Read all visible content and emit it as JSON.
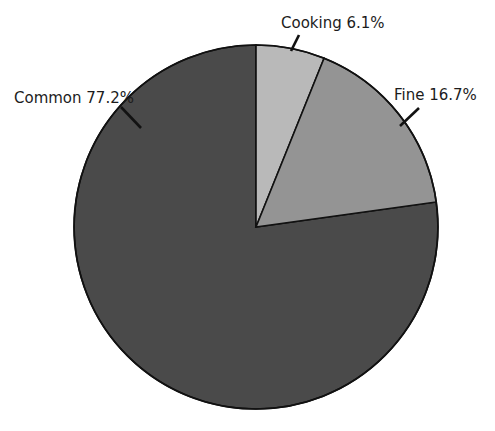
{
  "chart_data": {
    "type": "pie",
    "title": "Rice Mill Products",
    "title_clipped": true,
    "categories": [
      "Cooking",
      "Fine",
      "Common"
    ],
    "values": [
      6.1,
      16.7,
      77.2
    ],
    "value_unit": "%",
    "labels": [
      "Cooking 6.1%",
      "Fine 16.7%",
      "Common 77.2%"
    ],
    "slice_colors": [
      "#b9b9b9",
      "#949494",
      "#4a4a4a"
    ],
    "outline_color": "#111111",
    "start_angle_deg": 0,
    "direction": "clockwise",
    "legend": "none",
    "grid": false,
    "xlabel": "",
    "ylabel": "",
    "geometry": {
      "center_x": 256,
      "center_y": 227,
      "radius": 182
    },
    "slices": [
      {
        "name": "Cooking",
        "label": "Cooking 6.1%",
        "value": 6.1,
        "color": "#b9b9b9",
        "start_angle_deg": 0.0,
        "end_angle_deg": 21.96,
        "label_x": 281,
        "label_y": 14,
        "leader": {
          "x1": 291,
          "y1": 51,
          "x2": 299,
          "y2": 35
        }
      },
      {
        "name": "Fine",
        "label": "Fine 16.7%",
        "value": 16.7,
        "color": "#949494",
        "start_angle_deg": 21.96,
        "end_angle_deg": 82.08,
        "label_x": 394,
        "label_y": 86,
        "leader": {
          "x1": 400,
          "y1": 126,
          "x2": 419,
          "y2": 108
        }
      },
      {
        "name": "Common",
        "label": "Common 77.2%",
        "value": 77.2,
        "color": "#4a4a4a",
        "start_angle_deg": 82.08,
        "end_angle_deg": 360.0,
        "label_x": 14,
        "label_y": 89,
        "leader": {
          "x1": 121,
          "y1": 107,
          "x2": 141,
          "y2": 128
        }
      }
    ]
  }
}
